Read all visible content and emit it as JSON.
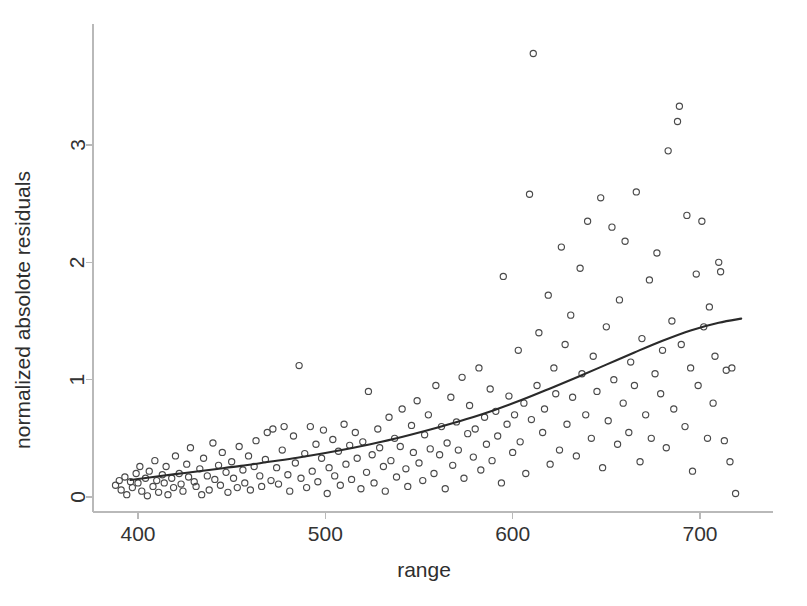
{
  "chart_data": {
    "type": "scatter",
    "title": "",
    "xlabel": "range",
    "ylabel": "normalized absolote residuals",
    "xlim": [
      380,
      727
    ],
    "ylim": [
      -0.08,
      3.95
    ],
    "xticks": [
      400,
      500,
      600,
      700
    ],
    "xtick_labels": [
      "400",
      "500",
      "600",
      "700"
    ],
    "yticks": [
      0,
      1,
      2,
      3
    ],
    "ytick_labels": [
      "0",
      "1",
      "2",
      "3"
    ],
    "grid": false,
    "legend": null,
    "marker": "open-circle",
    "marker_color": "#4a4a4a",
    "line_color": "#2a2a2a",
    "background_color": "#ffffff",
    "series": [
      {
        "name": "normalized absolute residuals",
        "type": "scatter",
        "points": [
          [
            388,
            0.1
          ],
          [
            390,
            0.14
          ],
          [
            391,
            0.06
          ],
          [
            393,
            0.17
          ],
          [
            394,
            0.02
          ],
          [
            396,
            0.13
          ],
          [
            397,
            0.08
          ],
          [
            399,
            0.2
          ],
          [
            400,
            0.12
          ],
          [
            401,
            0.26
          ],
          [
            402,
            0.05
          ],
          [
            404,
            0.16
          ],
          [
            405,
            0.01
          ],
          [
            406,
            0.22
          ],
          [
            408,
            0.09
          ],
          [
            409,
            0.31
          ],
          [
            410,
            0.14
          ],
          [
            411,
            0.04
          ],
          [
            413,
            0.19
          ],
          [
            414,
            0.12
          ],
          [
            415,
            0.26
          ],
          [
            416,
            0.02
          ],
          [
            418,
            0.16
          ],
          [
            419,
            0.08
          ],
          [
            420,
            0.35
          ],
          [
            422,
            0.2
          ],
          [
            423,
            0.11
          ],
          [
            424,
            0.05
          ],
          [
            426,
            0.28
          ],
          [
            427,
            0.17
          ],
          [
            428,
            0.42
          ],
          [
            430,
            0.13
          ],
          [
            431,
            0.09
          ],
          [
            433,
            0.24
          ],
          [
            434,
            0.02
          ],
          [
            435,
            0.33
          ],
          [
            437,
            0.18
          ],
          [
            438,
            0.06
          ],
          [
            440,
            0.46
          ],
          [
            441,
            0.15
          ],
          [
            443,
            0.27
          ],
          [
            444,
            0.1
          ],
          [
            445,
            0.38
          ],
          [
            447,
            0.21
          ],
          [
            448,
            0.04
          ],
          [
            450,
            0.3
          ],
          [
            451,
            0.16
          ],
          [
            453,
            0.08
          ],
          [
            454,
            0.43
          ],
          [
            456,
            0.23
          ],
          [
            457,
            0.12
          ],
          [
            459,
            0.35
          ],
          [
            460,
            0.06
          ],
          [
            462,
            0.26
          ],
          [
            463,
            0.48
          ],
          [
            465,
            0.18
          ],
          [
            466,
            0.09
          ],
          [
            468,
            0.32
          ],
          [
            469,
            0.55
          ],
          [
            471,
            0.14
          ],
          [
            472,
            0.58
          ],
          [
            474,
            0.25
          ],
          [
            475,
            0.11
          ],
          [
            477,
            0.4
          ],
          [
            478,
            0.6
          ],
          [
            480,
            0.19
          ],
          [
            481,
            0.05
          ],
          [
            483,
            0.52
          ],
          [
            484,
            0.29
          ],
          [
            486,
            1.12
          ],
          [
            487,
            0.16
          ],
          [
            489,
            0.37
          ],
          [
            490,
            0.08
          ],
          [
            492,
            0.6
          ],
          [
            493,
            0.22
          ],
          [
            495,
            0.45
          ],
          [
            496,
            0.13
          ],
          [
            498,
            0.33
          ],
          [
            499,
            0.57
          ],
          [
            501,
            0.03
          ],
          [
            502,
            0.25
          ],
          [
            504,
            0.49
          ],
          [
            505,
            0.18
          ],
          [
            507,
            0.39
          ],
          [
            508,
            0.1
          ],
          [
            510,
            0.62
          ],
          [
            511,
            0.28
          ],
          [
            513,
            0.44
          ],
          [
            514,
            0.15
          ],
          [
            516,
            0.55
          ],
          [
            517,
            0.33
          ],
          [
            519,
            0.07
          ],
          [
            520,
            0.47
          ],
          [
            522,
            0.21
          ],
          [
            523,
            0.9
          ],
          [
            525,
            0.36
          ],
          [
            526,
            0.12
          ],
          [
            528,
            0.58
          ],
          [
            529,
            0.42
          ],
          [
            531,
            0.26
          ],
          [
            532,
            0.05
          ],
          [
            534,
            0.68
          ],
          [
            535,
            0.31
          ],
          [
            537,
            0.5
          ],
          [
            538,
            0.17
          ],
          [
            540,
            0.43
          ],
          [
            541,
            0.75
          ],
          [
            543,
            0.24
          ],
          [
            544,
            0.09
          ],
          [
            546,
            0.61
          ],
          [
            547,
            0.38
          ],
          [
            549,
            0.82
          ],
          [
            550,
            0.29
          ],
          [
            552,
            0.14
          ],
          [
            553,
            0.53
          ],
          [
            555,
            0.7
          ],
          [
            556,
            0.41
          ],
          [
            558,
            0.2
          ],
          [
            559,
            0.95
          ],
          [
            561,
            0.36
          ],
          [
            562,
            0.6
          ],
          [
            564,
            0.07
          ],
          [
            565,
            0.46
          ],
          [
            567,
            0.85
          ],
          [
            568,
            0.27
          ],
          [
            570,
            0.64
          ],
          [
            571,
            0.4
          ],
          [
            573,
            1.02
          ],
          [
            574,
            0.16
          ],
          [
            576,
            0.54
          ],
          [
            577,
            0.78
          ],
          [
            579,
            0.34
          ],
          [
            580,
            0.58
          ],
          [
            582,
            1.1
          ],
          [
            583,
            0.23
          ],
          [
            585,
            0.68
          ],
          [
            586,
            0.45
          ],
          [
            588,
            0.92
          ],
          [
            589,
            0.31
          ],
          [
            591,
            0.73
          ],
          [
            592,
            0.52
          ],
          [
            594,
            0.12
          ],
          [
            595,
            1.88
          ],
          [
            597,
            0.62
          ],
          [
            598,
            0.86
          ],
          [
            600,
            0.38
          ],
          [
            601,
            0.7
          ],
          [
            603,
            1.25
          ],
          [
            604,
            0.47
          ],
          [
            606,
            0.8
          ],
          [
            607,
            0.2
          ],
          [
            609,
            2.58
          ],
          [
            610,
            0.66
          ],
          [
            611,
            3.78
          ],
          [
            613,
            0.95
          ],
          [
            614,
            1.4
          ],
          [
            616,
            0.55
          ],
          [
            617,
            0.75
          ],
          [
            619,
            1.72
          ],
          [
            620,
            0.28
          ],
          [
            622,
            1.1
          ],
          [
            623,
            0.88
          ],
          [
            625,
            0.4
          ],
          [
            626,
            2.13
          ],
          [
            628,
            1.3
          ],
          [
            629,
            0.62
          ],
          [
            631,
            1.55
          ],
          [
            632,
            0.85
          ],
          [
            634,
            0.35
          ],
          [
            636,
            1.95
          ],
          [
            637,
            1.05
          ],
          [
            639,
            0.7
          ],
          [
            640,
            2.35
          ],
          [
            642,
            0.5
          ],
          [
            643,
            1.2
          ],
          [
            645,
            0.9
          ],
          [
            647,
            2.55
          ],
          [
            648,
            0.25
          ],
          [
            650,
            1.45
          ],
          [
            651,
            0.65
          ],
          [
            653,
            2.3
          ],
          [
            654,
            1.0
          ],
          [
            656,
            0.45
          ],
          [
            657,
            1.68
          ],
          [
            659,
            0.8
          ],
          [
            660,
            2.18
          ],
          [
            662,
            0.55
          ],
          [
            663,
            1.15
          ],
          [
            665,
            0.95
          ],
          [
            666,
            2.6
          ],
          [
            668,
            0.3
          ],
          [
            669,
            1.35
          ],
          [
            671,
            0.7
          ],
          [
            673,
            1.85
          ],
          [
            674,
            0.5
          ],
          [
            676,
            1.05
          ],
          [
            677,
            2.08
          ],
          [
            679,
            0.88
          ],
          [
            680,
            1.25
          ],
          [
            682,
            0.42
          ],
          [
            683,
            2.95
          ],
          [
            685,
            1.5
          ],
          [
            686,
            0.75
          ],
          [
            688,
            3.2
          ],
          [
            689,
            3.33
          ],
          [
            690,
            1.3
          ],
          [
            692,
            0.6
          ],
          [
            693,
            2.4
          ],
          [
            695,
            1.1
          ],
          [
            696,
            0.22
          ],
          [
            698,
            1.9
          ],
          [
            699,
            0.95
          ],
          [
            701,
            2.35
          ],
          [
            702,
            1.45
          ],
          [
            704,
            0.5
          ],
          [
            705,
            1.62
          ],
          [
            707,
            0.8
          ],
          [
            708,
            1.2
          ],
          [
            710,
            2.0
          ],
          [
            711,
            1.92
          ],
          [
            713,
            0.48
          ],
          [
            714,
            1.08
          ],
          [
            716,
            0.3
          ],
          [
            717,
            1.1
          ],
          [
            719,
            0.03
          ]
        ]
      },
      {
        "name": "loess trend",
        "type": "line",
        "points": [
          [
            396,
            0.145
          ],
          [
            410,
            0.175
          ],
          [
            425,
            0.205
          ],
          [
            440,
            0.235
          ],
          [
            455,
            0.265
          ],
          [
            470,
            0.3
          ],
          [
            485,
            0.335
          ],
          [
            500,
            0.375
          ],
          [
            515,
            0.42
          ],
          [
            530,
            0.47
          ],
          [
            545,
            0.528
          ],
          [
            560,
            0.592
          ],
          [
            575,
            0.662
          ],
          [
            590,
            0.74
          ],
          [
            605,
            0.828
          ],
          [
            620,
            0.925
          ],
          [
            635,
            1.025
          ],
          [
            650,
            1.128
          ],
          [
            665,
            1.232
          ],
          [
            680,
            1.332
          ],
          [
            695,
            1.42
          ],
          [
            710,
            1.485
          ],
          [
            722,
            1.52
          ]
        ]
      }
    ]
  },
  "axes": {
    "x_axis_name": "range-axis",
    "y_axis_name": "normalized-absolote-residuals-axis"
  }
}
